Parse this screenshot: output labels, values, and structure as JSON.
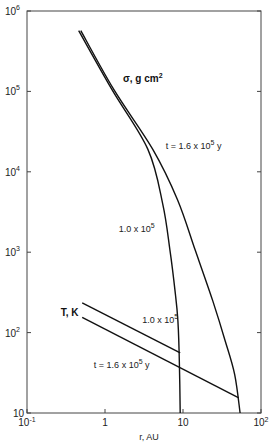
{
  "chart_data": {
    "type": "line",
    "title": "",
    "xlabel": "r, AU",
    "ylabel": "",
    "xscale": "log",
    "yscale": "log",
    "xlim": [
      0.1,
      100
    ],
    "ylim": [
      10,
      1000000
    ],
    "grid": false,
    "x_ticks": [
      {
        "value": 0.1,
        "base": "10",
        "exp": "-1"
      },
      {
        "value": 1,
        "base": "1",
        "exp": ""
      },
      {
        "value": 10,
        "base": "10",
        "exp": ""
      },
      {
        "value": 100,
        "base": "10",
        "exp": "2"
      }
    ],
    "y_ticks": [
      {
        "value": 1000000,
        "base": "10",
        "exp": "6"
      },
      {
        "value": 100000,
        "base": "10",
        "exp": "5"
      },
      {
        "value": 10000,
        "base": "10",
        "exp": "4"
      },
      {
        "value": 1000,
        "base": "10",
        "exp": "3"
      },
      {
        "value": 100,
        "base": "10",
        "exp": "2"
      },
      {
        "value": 10,
        "base": "10",
        "exp": ""
      }
    ],
    "series": [
      {
        "name": "sigma t=1.0e5",
        "quantity": "σ, g cm²",
        "time": "1.0 x 10^5",
        "x": [
          0.46,
          1.23,
          3.55,
          5.5,
          6.8,
          8.0,
          8.6,
          9.0,
          9.2
        ],
        "y": [
          570000,
          105000,
          19000,
          4000,
          1070,
          300,
          140,
          40,
          10
        ]
      },
      {
        "name": "sigma t=1.6e5",
        "quantity": "σ, g cm²",
        "time": "1.6 x 10^5",
        "x": [
          0.49,
          1.3,
          4.1,
          8.5,
          14.3,
          24,
          34.5,
          46,
          54
        ],
        "y": [
          570000,
          105000,
          19000,
          4500,
          1070,
          250,
          81,
          30,
          10
        ]
      },
      {
        "name": "T t=1.0e5",
        "quantity": "T, K",
        "time": "1.0 x 10^5",
        "x": [
          0.51,
          9.2
        ],
        "y": [
          235,
          56
        ]
      },
      {
        "name": "T t=1.6e5",
        "quantity": "T, K",
        "time": "1.6 x 10^5",
        "x": [
          0.51,
          52
        ],
        "y": [
          155,
          15.4
        ]
      }
    ],
    "annotations": {
      "sigma_label": {
        "text": "σ, g  cm",
        "sup": "2",
        "r": 1.7,
        "v": 130000
      },
      "sigma_t16": {
        "prefix": "t = 1.6 x 10",
        "sup": "5",
        "suffix": " y",
        "r": 6.0,
        "v": 19000
      },
      "sigma_t10": {
        "prefix": "1.0 x 10",
        "sup": "5",
        "suffix": "",
        "r": 1.5,
        "v": 1800
      },
      "T_label": {
        "text": "T, K",
        "r": 0.27,
        "v": 160
      },
      "T_t10": {
        "prefix": "1.0 x 10",
        "sup": "5",
        "suffix": "",
        "r": 3.0,
        "v": 130
      },
      "T_t16": {
        "prefix": "t = 1.6 x 10",
        "sup": "5",
        "suffix": " y",
        "r": 0.72,
        "v": 36
      }
    }
  }
}
